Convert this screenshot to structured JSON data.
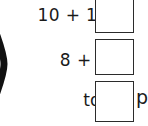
{
  "worksheet": {
    "bracket_symbol": ")",
    "rows": [
      {
        "expression": "10 + 10 =",
        "answer_value": "",
        "answer_placeholder": ""
      },
      {
        "expression": "8 + 8 =",
        "answer_value": "",
        "answer_placeholder": ""
      }
    ],
    "total": {
      "label": "total:",
      "answer_value": "",
      "answer_placeholder": "",
      "trailing_text": "p"
    }
  },
  "colors": {
    "ink": "#1a1a1a",
    "box_border": "#2b2b2b",
    "background": "#ffffff"
  }
}
